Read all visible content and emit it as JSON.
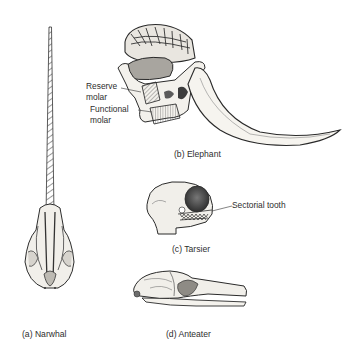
{
  "figure": {
    "panels": [
      {
        "id": "a",
        "caption": "(a) Narwhal",
        "subject": "narwhal-skull-with-tusk"
      },
      {
        "id": "b",
        "caption": "(b) Elephant",
        "subject": "elephant-skull-section",
        "callouts": [
          "Reserve",
          "molar",
          "Functional",
          "molar"
        ]
      },
      {
        "id": "c",
        "caption": "(c) Tarsier",
        "subject": "tarsier-skull",
        "callouts": [
          "Sectorial tooth"
        ]
      },
      {
        "id": "d",
        "caption": "(d) Anteater",
        "subject": "anteater-skull"
      }
    ]
  },
  "colors": {
    "background": "#ffffff",
    "ink": "#2a2a2a",
    "shade": "#8a8a8a",
    "bone": "#f2f0ec"
  }
}
